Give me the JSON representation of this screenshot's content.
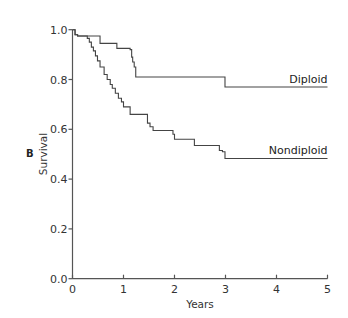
{
  "chart_data": {
    "type": "line",
    "subtype": "kaplan-meier-step",
    "panel_label": "B",
    "title": "",
    "xlabel": "Years",
    "ylabel": "Survival",
    "xlim": [
      0,
      5
    ],
    "ylim": [
      0,
      1.0
    ],
    "xticks": [
      0,
      1,
      2,
      3,
      4,
      5
    ],
    "xtick_labels": [
      "0",
      "1",
      "2",
      "3",
      "4",
      "5"
    ],
    "yticks": [
      0,
      0.2,
      0.4,
      0.6,
      0.8,
      1.0
    ],
    "ytick_labels": [
      "0.0",
      "0.2",
      "0.4",
      "0.6",
      "0.8",
      "1.0"
    ],
    "grid": false,
    "legend": "inline labels at right end of curves",
    "line_color": "#444444",
    "series": [
      {
        "name": "Diploid",
        "label": "Diploid",
        "end_x": 5,
        "steps": [
          [
            0,
            1.0
          ],
          [
            0.05,
            0.98
          ],
          [
            0.1,
            0.975
          ],
          [
            0.54,
            0.945
          ],
          [
            0.87,
            0.925
          ],
          [
            1.13,
            0.92
          ],
          [
            1.16,
            0.89
          ],
          [
            1.18,
            0.87
          ],
          [
            1.21,
            0.85
          ],
          [
            1.24,
            0.81
          ],
          [
            2.99,
            0.77
          ]
        ]
      },
      {
        "name": "Nondiploid",
        "label": "Nondiploid",
        "end_x": 5,
        "steps": [
          [
            0,
            1.0
          ],
          [
            0.05,
            0.98
          ],
          [
            0.1,
            0.975
          ],
          [
            0.29,
            0.965
          ],
          [
            0.33,
            0.95
          ],
          [
            0.37,
            0.93
          ],
          [
            0.41,
            0.915
          ],
          [
            0.45,
            0.895
          ],
          [
            0.49,
            0.875
          ],
          [
            0.54,
            0.85
          ],
          [
            0.62,
            0.82
          ],
          [
            0.68,
            0.8
          ],
          [
            0.74,
            0.78
          ],
          [
            0.78,
            0.765
          ],
          [
            0.84,
            0.745
          ],
          [
            0.9,
            0.725
          ],
          [
            0.96,
            0.71
          ],
          [
            1.0,
            0.69
          ],
          [
            1.13,
            0.66
          ],
          [
            1.47,
            0.625
          ],
          [
            1.52,
            0.61
          ],
          [
            1.58,
            0.595
          ],
          [
            1.97,
            0.58
          ],
          [
            2.0,
            0.56
          ],
          [
            2.39,
            0.535
          ],
          [
            2.88,
            0.515
          ],
          [
            2.94,
            0.51
          ],
          [
            2.99,
            0.483
          ]
        ]
      }
    ]
  }
}
